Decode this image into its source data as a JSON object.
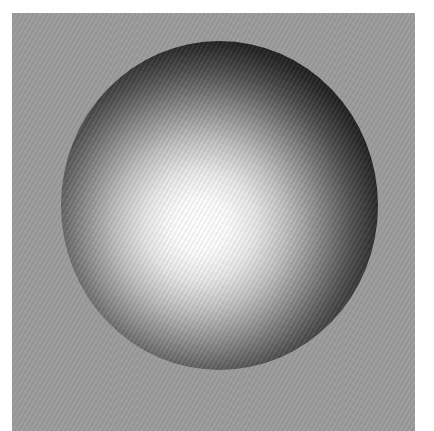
{
  "scene": {
    "description": "Shaded 3D sphere on gray square background",
    "background_color": "#ffffff",
    "panel": {
      "color": "#9b9b9b"
    },
    "sphere": {
      "highlight_color": "#ffffff",
      "shadow_color": "#1a1a1a",
      "shape": "circle"
    }
  }
}
